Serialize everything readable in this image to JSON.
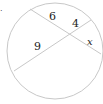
{
  "diagram": {
    "type": "circle-intersecting-chords",
    "marker": ".",
    "circle": {
      "cx": 55,
      "cy": 51,
      "r": 48,
      "stroke": "#c8c8c8"
    },
    "chords": [
      {
        "name": "chord-a",
        "x1": 30,
        "y1": 9,
        "x2": 101,
        "y2": 54,
        "stroke": "#c8c8c8"
      },
      {
        "name": "chord-b",
        "x1": 91,
        "y1": 20,
        "x2": 14,
        "y2": 71,
        "stroke": "#c8c8c8"
      }
    ],
    "intersection": {
      "x": 68,
      "y": 35
    },
    "labels": {
      "seg_top_left": "6",
      "seg_top_right": "4",
      "seg_bottom_left": "9",
      "seg_right": "x"
    }
  }
}
